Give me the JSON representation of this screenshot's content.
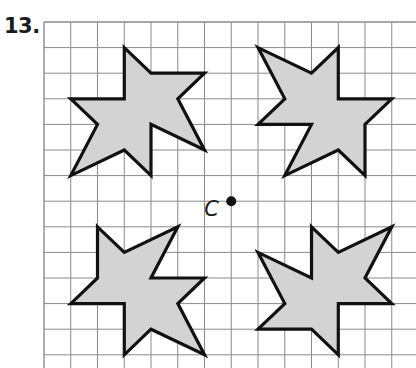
{
  "problem": {
    "number": "13.",
    "center_point_label": "C"
  },
  "grid": {
    "origin_px": [
      44,
      22
    ],
    "cell_w": 26.75,
    "cell_h": 25.6,
    "columns": 14,
    "rows": 14,
    "line_color": "#8a8a8a"
  },
  "center_point": {
    "label": "C",
    "grid": [
      7,
      7
    ]
  },
  "style": {
    "fill": "#d3d3d3",
    "stroke": "#111111",
    "stroke_width": 3.2
  },
  "shapes": [
    {
      "name": "star-top-left",
      "points": [
        [
          3,
          1
        ],
        [
          4,
          2
        ],
        [
          6,
          2
        ],
        [
          5,
          3
        ],
        [
          6,
          5
        ],
        [
          4,
          4
        ],
        [
          4,
          6
        ],
        [
          3,
          5
        ],
        [
          1,
          6
        ],
        [
          2,
          4
        ],
        [
          1,
          3
        ],
        [
          3,
          3
        ]
      ]
    },
    {
      "name": "star-top-right",
      "points": [
        [
          8,
          1
        ],
        [
          10,
          2
        ],
        [
          11,
          1
        ],
        [
          11,
          3
        ],
        [
          13,
          3
        ],
        [
          12,
          4
        ],
        [
          12,
          6
        ],
        [
          11,
          5
        ],
        [
          9,
          6
        ],
        [
          10,
          4
        ],
        [
          8,
          4
        ],
        [
          9,
          3
        ]
      ]
    },
    {
      "name": "star-bottom-left",
      "points": [
        [
          2,
          8
        ],
        [
          3,
          9
        ],
        [
          5,
          8
        ],
        [
          4,
          10
        ],
        [
          6,
          10
        ],
        [
          5,
          11
        ],
        [
          6,
          13
        ],
        [
          4,
          12
        ],
        [
          3,
          13
        ],
        [
          3,
          11
        ],
        [
          1,
          11
        ],
        [
          2,
          10
        ]
      ]
    },
    {
      "name": "star-bottom-right",
      "points": [
        [
          10,
          8
        ],
        [
          11,
          9
        ],
        [
          13,
          8
        ],
        [
          12,
          10
        ],
        [
          13,
          11
        ],
        [
          11,
          11
        ],
        [
          11,
          13
        ],
        [
          10,
          12
        ],
        [
          8,
          12
        ],
        [
          9,
          11
        ],
        [
          8,
          9
        ],
        [
          10,
          10
        ]
      ]
    }
  ]
}
